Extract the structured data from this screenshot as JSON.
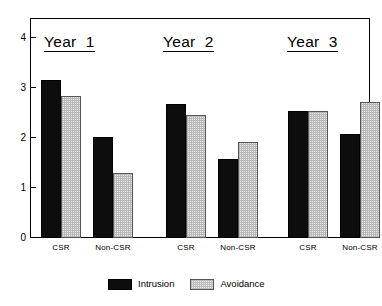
{
  "chart_data": {
    "type": "bar",
    "title": "",
    "xlabel": "",
    "ylabel": "",
    "ylim": [
      0,
      4
    ],
    "yticks": [
      0,
      1,
      2,
      3,
      4
    ],
    "ytick_labels": [
      "0",
      "1",
      "2",
      "3",
      "4"
    ],
    "grid": false,
    "legend_position": "bottom-center",
    "groups": [
      {
        "title": "Year  1",
        "categories": [
          "CSR",
          "Non-CSR"
        ],
        "series": [
          {
            "name": "Intrusion",
            "values": [
              3.16,
              2.03
            ]
          },
          {
            "name": "Avoidance",
            "values": [
              2.84,
              1.3
            ]
          }
        ]
      },
      {
        "title": "Year  2",
        "categories": [
          "CSR",
          "Non-CSR"
        ],
        "series": [
          {
            "name": "Intrusion",
            "values": [
              2.68,
              1.58
            ]
          },
          {
            "name": "Avoidance",
            "values": [
              2.46,
              1.92
            ]
          }
        ]
      },
      {
        "title": "Year  3",
        "categories": [
          "CSR",
          "Non-CSR"
        ],
        "series": [
          {
            "name": "Intrusion",
            "values": [
              2.54,
              2.08
            ]
          },
          {
            "name": "Avoidance",
            "values": [
              2.55,
              2.72
            ]
          }
        ]
      }
    ],
    "legend": [
      {
        "name": "Intrusion",
        "color": "#0d0d0d",
        "pattern": "solid"
      },
      {
        "name": "Avoidance",
        "color": "#e9e9e9",
        "pattern": "dotted-hatch"
      }
    ],
    "colors": {
      "intrusion": "#0d0d0d",
      "avoidance": "#e9e9e9",
      "axis": "#000000",
      "background": "#ffffff"
    }
  }
}
